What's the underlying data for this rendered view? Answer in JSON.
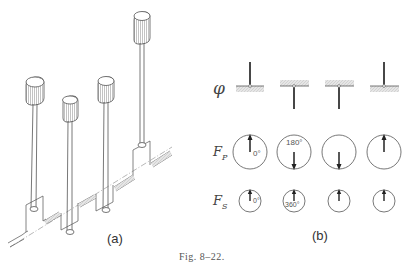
{
  "figure": {
    "caption": "Fig. 8–22.",
    "panel_a": {
      "label": "(a)",
      "description": "Four-cylinder crankshaft with pistons on connecting rods, shown in isometric view",
      "pistons": [
        {
          "index": 1,
          "position": "mid"
        },
        {
          "index": 2,
          "position": "low"
        },
        {
          "index": 3,
          "position": "mid"
        },
        {
          "index": 4,
          "position": "high"
        }
      ]
    },
    "panel_b": {
      "label": "(b)",
      "rows": [
        {
          "symbol": "φ",
          "name": "crank-angle"
        },
        {
          "symbol": "F",
          "subscript": "P",
          "name": "primary-force"
        },
        {
          "symbol": "F",
          "subscript": "S",
          "name": "secondary-force"
        }
      ],
      "columns": [
        {
          "crank": "up",
          "fp_dir": "up",
          "fp_label": "0°",
          "fs_dir": "up",
          "fs_label": "0°"
        },
        {
          "crank": "down",
          "fp_dir": "down",
          "fp_label": "180°",
          "fs_dir": "up",
          "fs_label": "360°"
        },
        {
          "crank": "down",
          "fp_dir": "down",
          "fp_label": "",
          "fs_dir": "up",
          "fs_label": ""
        },
        {
          "crank": "up",
          "fp_dir": "up",
          "fp_label": "",
          "fs_dir": "up",
          "fs_label": ""
        }
      ]
    }
  },
  "text": {
    "phi": "φ",
    "fp_main": "F",
    "fp_sub": "P",
    "fs_main": "F",
    "fs_sub": "S",
    "a_label": "(a)",
    "b_label": "(b)",
    "caption": "Fig. 8–22.",
    "deg0_fp": "0°",
    "deg180": "180°",
    "deg0_fs": "0°",
    "deg360": "360°"
  },
  "colors": {
    "ink": "#555555",
    "hatch": "#bbbbbb",
    "background": "#ffffff"
  }
}
